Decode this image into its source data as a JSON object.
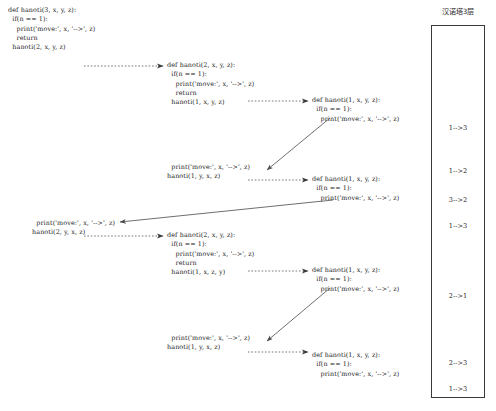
{
  "panel": {
    "title": "汉诺塔3层",
    "moves": [
      {
        "label": "1-->3",
        "top": 124
      },
      {
        "label": "1-->2",
        "top": 167
      },
      {
        "label": "3-->2",
        "top": 196
      },
      {
        "label": "1-->3",
        "top": 222
      },
      {
        "label": "2-->1",
        "top": 292
      },
      {
        "label": "2-->3",
        "top": 359
      },
      {
        "label": "1-->3",
        "top": 385
      }
    ]
  },
  "blocks": [
    {
      "name": "call-hanoti-3-x-y-z",
      "left": 8,
      "top": 6,
      "lines": [
        "def hanoti(3, x, y, z):",
        "  if(n == 1):",
        "    print('move:', x, '-->', z)",
        "    return",
        "  hanoti(2, x, y, z)"
      ]
    },
    {
      "name": "call-hanoti-2-x-y-z-first",
      "left": 167,
      "top": 61,
      "lines": [
        "def hanoti(2, x, y, z):",
        "  if(n == 1):",
        "    print('move:', x, '-->', z)",
        "    return",
        "  hanoti(1, x, y, z)"
      ]
    },
    {
      "name": "call-hanoti-1-x-y-z-first",
      "left": 312,
      "top": 96,
      "lines": [
        "def hanoti(1, x, y, z):",
        "  if(n == 1):",
        "    print('move:', x, '-->', z)"
      ]
    },
    {
      "name": "return-print-and-call-1-y-x-z-first",
      "left": 167,
      "top": 163,
      "lines": [
        "  print('move:', x, '-->', z)",
        "hanoti(1, y, x, z)"
      ]
    },
    {
      "name": "call-hanoti-1-x-y-z-second",
      "left": 312,
      "top": 175,
      "lines": [
        "def hanoti(1, x, y, z):",
        "  if(n == 1):",
        "    print('move:', x, '-->', z)"
      ]
    },
    {
      "name": "return-print-and-call-2-y-x-z",
      "left": 32,
      "top": 219,
      "lines": [
        "  print('move:', x, '-->', z)",
        "hanoti(2, y, x, z)"
      ]
    },
    {
      "name": "call-hanoti-2-x-y-z-second",
      "left": 167,
      "top": 231,
      "lines": [
        "def hanoti(2, x, y, z):",
        "  if(n == 1):",
        "    print('move:', x, '-->', z)",
        "    return",
        "  hanoti(1, x, z, y)"
      ]
    },
    {
      "name": "call-hanoti-1-x-y-z-third",
      "left": 312,
      "top": 266,
      "lines": [
        "def hanoti(1, x, y, z):",
        "  if(n == 1):",
        "    print('move:', x, '-->', z)"
      ]
    },
    {
      "name": "return-print-and-call-1-y-x-z-second",
      "left": 167,
      "top": 334,
      "lines": [
        "  print('move:', x, '-->', z)",
        "hanoti(1, y, x, z)"
      ]
    },
    {
      "name": "call-hanoti-1-x-y-z-fourth",
      "left": 312,
      "top": 351,
      "lines": [
        "def hanoti(1, x, y, z):",
        "  if(n == 1):",
        "    print('move:', x, '-->', z)"
      ]
    }
  ],
  "arrows": [
    {
      "name": "arrow-call-3-to-2",
      "style": "dotted",
      "x1": 84,
      "y1": 66,
      "x2": 163,
      "y2": 66
    },
    {
      "name": "arrow-call-2-to-1-first",
      "style": "dotted",
      "x1": 248,
      "y1": 101,
      "x2": 308,
      "y2": 101
    },
    {
      "name": "arrow-return-1-to-print-first",
      "style": "solid",
      "x1": 330,
      "y1": 118,
      "x2": 267,
      "y2": 170
    },
    {
      "name": "arrow-call-print-to-1-second",
      "style": "dotted",
      "x1": 248,
      "y1": 180,
      "x2": 308,
      "y2": 180
    },
    {
      "name": "arrow-return-1-to-print-second",
      "style": "solid",
      "x1": 333,
      "y1": 200,
      "x2": 120,
      "y2": 222
    },
    {
      "name": "arrow-call-2y-to-2",
      "style": "dotted",
      "x1": 84,
      "y1": 236,
      "x2": 163,
      "y2": 236
    },
    {
      "name": "arrow-call-2-to-1-third",
      "style": "dotted",
      "x1": 248,
      "y1": 271,
      "x2": 308,
      "y2": 271
    },
    {
      "name": "arrow-return-1-to-print-third",
      "style": "solid",
      "x1": 330,
      "y1": 288,
      "x2": 267,
      "y2": 341
    },
    {
      "name": "arrow-call-print-to-1-fourth",
      "style": "dotted",
      "x1": 248,
      "y1": 352,
      "x2": 308,
      "y2": 352
    }
  ]
}
